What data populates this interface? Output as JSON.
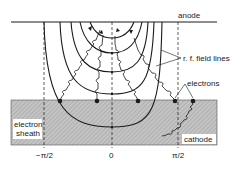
{
  "labels": {
    "anode": "anode",
    "rf_field_lines": "r. f. field lines",
    "electrons": "electrons",
    "electron_sheath_line1": "electron",
    "electron_sheath_line2": "sheath",
    "cathode": "cathode"
  },
  "axis": {
    "ticks": [
      "−π/2",
      "0",
      "π/2"
    ]
  },
  "colors": {
    "line": "#1a1a1a",
    "cathode_fill": "#b8b8b8",
    "background": "#ffffff"
  }
}
